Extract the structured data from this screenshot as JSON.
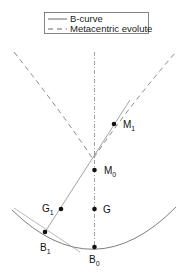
{
  "legend": {
    "items": [
      {
        "label": "B-curve",
        "style": "solid"
      },
      {
        "label": "Metacentric evolute",
        "style": "dashed"
      }
    ]
  },
  "points": {
    "M1": {
      "base": "M",
      "sub": "1"
    },
    "M0": {
      "base": "M",
      "sub": "0"
    },
    "G": {
      "base": "G",
      "sub": ""
    },
    "G1": {
      "base": "G",
      "sub": "1"
    },
    "B1": {
      "base": "B",
      "sub": "1"
    },
    "B0": {
      "base": "B",
      "sub": "0"
    }
  },
  "colors": {
    "curve": "#6e6e6e",
    "evolute": "#7a7a7a",
    "axis": "#888888",
    "point": "#111111"
  }
}
